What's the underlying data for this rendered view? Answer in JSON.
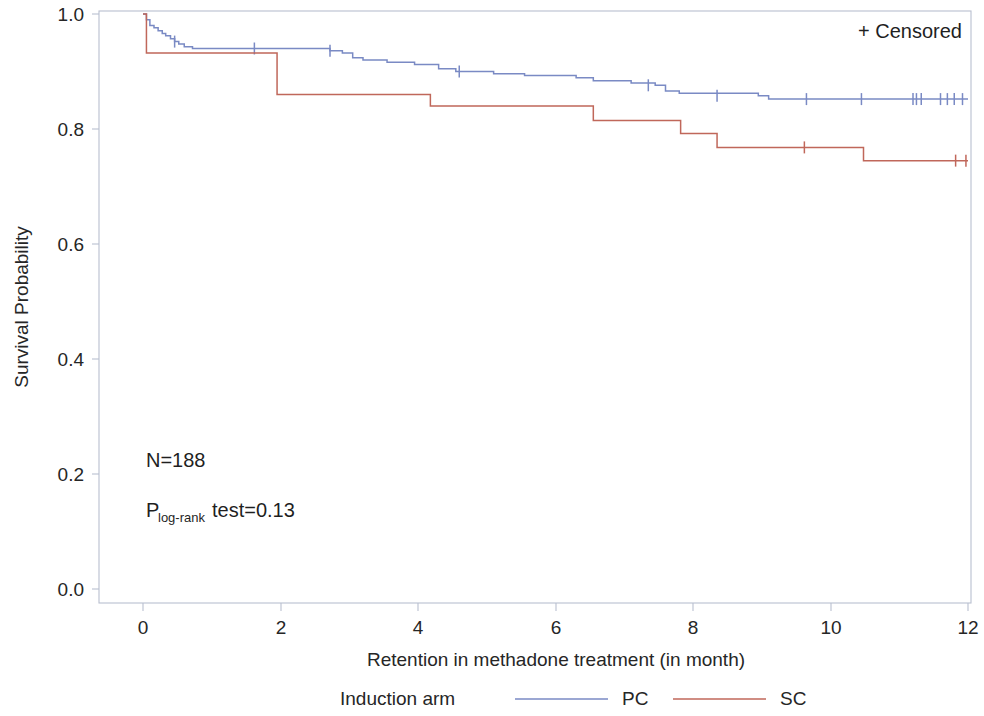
{
  "chart_data": {
    "type": "line",
    "subtype": "kaplan-meier-survival",
    "title": "",
    "xlabel": "Retention in methadone treatment (in month)",
    "ylabel": "Survival Probability",
    "xlim": [
      0,
      12
    ],
    "ylim": [
      0.0,
      1.0
    ],
    "xticks": [
      0,
      2,
      4,
      6,
      8,
      10,
      12
    ],
    "xtick_labels": [
      "0",
      "2",
      "4",
      "6",
      "8",
      "10",
      "12"
    ],
    "yticks": [
      0.0,
      0.2,
      0.4,
      0.6,
      0.8,
      1.0
    ],
    "ytick_labels": [
      "0.0",
      "0.2",
      "0.4",
      "0.6",
      "0.8",
      "1.0"
    ],
    "grid": false,
    "legend_position": "bottom",
    "legend_title": "Induction arm",
    "censored_label": "+ Censored",
    "annotations": [
      {
        "id": "n-annotation",
        "text": "N=188",
        "x": 0.35,
        "y": 0.205
      },
      {
        "id": "p-annotation",
        "prefix": "P",
        "subscript": "log-rank",
        "suffix": " test=0.13",
        "x": 0.35,
        "y": 0.145
      }
    ],
    "series": [
      {
        "name": "PC",
        "label": "PC",
        "color": "#7a8ac4",
        "steps": [
          [
            0.0,
            1.0
          ],
          [
            0.05,
            0.99
          ],
          [
            0.1,
            0.98
          ],
          [
            0.16,
            0.976
          ],
          [
            0.22,
            0.971
          ],
          [
            0.28,
            0.966
          ],
          [
            0.33,
            0.962
          ],
          [
            0.4,
            0.957
          ],
          [
            0.46,
            0.952
          ],
          [
            0.52,
            0.948
          ],
          [
            0.6,
            0.943
          ],
          [
            0.72,
            0.94
          ],
          [
            2.6,
            0.94
          ],
          [
            2.72,
            0.936
          ],
          [
            2.9,
            0.932
          ],
          [
            3.05,
            0.924
          ],
          [
            3.2,
            0.92
          ],
          [
            3.55,
            0.916
          ],
          [
            3.95,
            0.912
          ],
          [
            4.3,
            0.905
          ],
          [
            4.55,
            0.9
          ],
          [
            5.1,
            0.896
          ],
          [
            5.55,
            0.893
          ],
          [
            6.3,
            0.889
          ],
          [
            6.55,
            0.884
          ],
          [
            7.1,
            0.88
          ],
          [
            7.45,
            0.876
          ],
          [
            7.6,
            0.866
          ],
          [
            7.8,
            0.862
          ],
          [
            8.95,
            0.858
          ],
          [
            9.1,
            0.852
          ],
          [
            12.0,
            0.852
          ]
        ],
        "censored": [
          [
            0.46,
            0.952
          ],
          [
            1.62,
            0.94
          ],
          [
            2.72,
            0.936
          ],
          [
            4.6,
            0.9
          ],
          [
            7.35,
            0.876
          ],
          [
            8.35,
            0.858
          ],
          [
            9.65,
            0.852
          ],
          [
            10.45,
            0.852
          ],
          [
            11.2,
            0.852
          ],
          [
            11.25,
            0.852
          ],
          [
            11.32,
            0.852
          ],
          [
            11.6,
            0.852
          ],
          [
            11.7,
            0.852
          ],
          [
            11.8,
            0.852
          ],
          [
            11.92,
            0.852
          ]
        ]
      },
      {
        "name": "SC",
        "label": "SC",
        "color": "#c0675a",
        "steps": [
          [
            0.0,
            1.0
          ],
          [
            0.05,
            0.932
          ],
          [
            1.88,
            0.932
          ],
          [
            1.95,
            0.86
          ],
          [
            4.1,
            0.86
          ],
          [
            4.18,
            0.84
          ],
          [
            6.45,
            0.84
          ],
          [
            6.55,
            0.815
          ],
          [
            7.7,
            0.815
          ],
          [
            7.82,
            0.792
          ],
          [
            8.22,
            0.792
          ],
          [
            8.35,
            0.768
          ],
          [
            10.38,
            0.768
          ],
          [
            10.48,
            0.745
          ],
          [
            12.0,
            0.745
          ]
        ],
        "censored": [
          [
            9.62,
            0.768
          ],
          [
            11.82,
            0.745
          ],
          [
            11.97,
            0.745
          ]
        ]
      }
    ]
  },
  "axes": {
    "x_label": "Retention in methadone treatment (in month)",
    "y_label": "Survival Probability"
  },
  "legend": {
    "title": "Induction arm",
    "entries": [
      {
        "label": "PC",
        "color": "#7a8ac4"
      },
      {
        "label": "SC",
        "color": "#c0675a"
      }
    ]
  },
  "censored_legend": {
    "symbol": "+",
    "label": "Censored",
    "full_text": "+ Censored"
  },
  "stats": {
    "sample_size_text": "N=188",
    "pvalue_prefix": "P",
    "pvalue_subscript": "log-rank",
    "pvalue_suffix": " test=0.13"
  }
}
